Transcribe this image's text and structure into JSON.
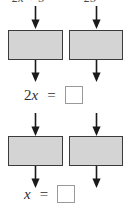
{
  "diagram": {
    "type": "flowchart",
    "top_labels": [
      {
        "id": "left-expression",
        "text": "2x + 5"
      },
      {
        "id": "right-expression",
        "text": "25"
      }
    ],
    "stages": [
      {
        "id": "stage-1",
        "boxes": [
          {
            "id": "op-box-1-left",
            "fill": "#d4d4d4",
            "stroke": "#3b3b3b"
          },
          {
            "id": "op-box-1-right",
            "fill": "#d4d4d4",
            "stroke": "#3b3b3b"
          }
        ],
        "equation": {
          "id": "equation-1",
          "left_coefficient": "2",
          "left_variable": "x",
          "operator": "=",
          "right_value": ""
        }
      },
      {
        "id": "stage-2",
        "boxes": [
          {
            "id": "op-box-2-left",
            "fill": "#d4d4d4",
            "stroke": "#3b3b3b"
          },
          {
            "id": "op-box-2-right",
            "fill": "#d4d4d4",
            "stroke": "#3b3b3b"
          }
        ],
        "equation": {
          "id": "equation-2",
          "left_coefficient": "",
          "left_variable": "x",
          "operator": "=",
          "right_value": ""
        }
      }
    ],
    "arrows": {
      "icon": "arrow-down-icon",
      "color": "#1a1a1a",
      "count": 8
    },
    "colors": {
      "box_fill": "#d4d4d4",
      "box_stroke": "#3b3b3b",
      "answer_box_stroke": "#9a9a9a",
      "text": "#2e2e2e",
      "background": "#ffffff"
    }
  }
}
